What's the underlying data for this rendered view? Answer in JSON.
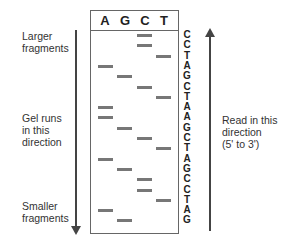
{
  "lanes": [
    "A",
    "G",
    "C",
    "T"
  ],
  "sequence": [
    "C",
    "C",
    "T",
    "A",
    "G",
    "C",
    "T",
    "A",
    "A",
    "G",
    "C",
    "T",
    "A",
    "G",
    "C",
    "C",
    "T",
    "A",
    "G"
  ],
  "left_labels": {
    "top": [
      "Larger",
      "fragments"
    ],
    "middle": [
      "Gel runs",
      "in this",
      "direction"
    ],
    "bottom": [
      "Smaller",
      "fragments"
    ]
  },
  "right_label": [
    "Read in this",
    "direction",
    "(5' to 3')"
  ],
  "colors": {
    "band": "#777777",
    "border": "#666666",
    "arrow": "#444444"
  }
}
